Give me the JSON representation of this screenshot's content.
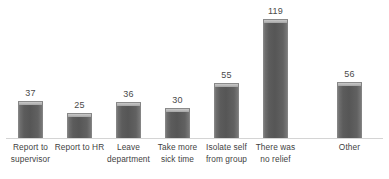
{
  "chart_data": {
    "type": "bar",
    "title": "",
    "subtitle": "",
    "xlabel": "",
    "ylabel": "",
    "ylim": [
      0,
      138
    ],
    "grid": false,
    "legend": null,
    "bar_color": "#595959",
    "axis_color": "#d4d4d4",
    "label_color": "#404040",
    "background": "#ffffff",
    "data_labels_shown": true,
    "categories": [
      "Report to supervisor",
      "Report to HR",
      "Leave department",
      "Take more sick time",
      "Isolate self from group",
      "There was no relief",
      "Other"
    ],
    "category_lines": [
      [
        "Report to",
        "supervisor"
      ],
      [
        "Report to HR",
        ""
      ],
      [
        "Leave",
        "department"
      ],
      [
        "Take more",
        "sick time"
      ],
      [
        "Isolate self",
        "from group"
      ],
      [
        "There was",
        "no relief"
      ],
      [
        "Other",
        ""
      ]
    ],
    "values": [
      37,
      25,
      36,
      30,
      55,
      119,
      56
    ],
    "value_labels": [
      "37",
      "25",
      "36",
      "30",
      "55",
      "119",
      "56"
    ]
  }
}
